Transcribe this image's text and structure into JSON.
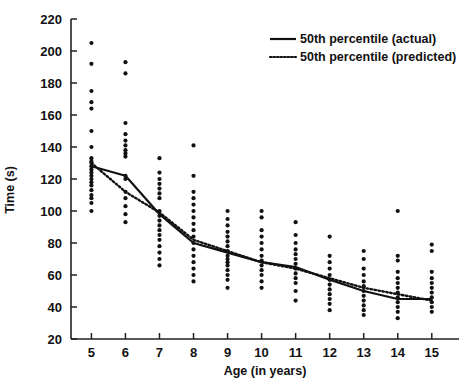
{
  "chart_data": {
    "type": "scatter",
    "title": "",
    "xlabel": "Age (in years)",
    "ylabel": "Time (s)",
    "xlim": [
      4.4,
      15.8
    ],
    "ylim": [
      20,
      220
    ],
    "xticks": [
      5,
      6,
      7,
      8,
      9,
      10,
      11,
      12,
      13,
      14,
      15
    ],
    "yticks": [
      20,
      40,
      60,
      80,
      100,
      120,
      140,
      160,
      180,
      200,
      220
    ],
    "grid": false,
    "legend_position": "top-right",
    "legend": [
      {
        "label": "50th percentile (actual)",
        "style": "solid",
        "color": "#111111"
      },
      {
        "label": "50th percentile (predicted)",
        "style": "dotted",
        "color": "#111111"
      }
    ],
    "series": [
      {
        "name": "50th percentile (actual)",
        "style": "solid",
        "x": [
          5,
          6,
          7,
          8,
          9,
          10,
          11,
          12,
          13,
          14,
          15
        ],
        "values": [
          128,
          122,
          98,
          80,
          74,
          68,
          65,
          57,
          50,
          45,
          45
        ]
      },
      {
        "name": "50th percentile (predicted)",
        "style": "dotted",
        "x": [
          5,
          6,
          7,
          8,
          9,
          10,
          11,
          12,
          13,
          14,
          15
        ],
        "values": [
          130,
          112,
          99,
          82,
          75,
          68,
          64,
          58,
          52,
          48,
          44
        ]
      }
    ],
    "scatter": {
      "name": "individual observations",
      "marker": "filled-circle",
      "color": "#111111",
      "points_by_age": {
        "5": [
          205,
          192,
          175,
          168,
          164,
          150,
          140,
          133,
          131,
          130,
          128,
          126,
          124,
          122,
          120,
          118,
          116,
          113,
          110,
          108,
          105,
          100
        ],
        "6": [
          193,
          186,
          155,
          148,
          144,
          141,
          138,
          136,
          134,
          122,
          120,
          112,
          108,
          103,
          98,
          93
        ],
        "7": [
          133,
          124,
          120,
          117,
          114,
          111,
          108,
          100,
          97,
          94,
          91,
          88,
          85,
          82,
          78,
          74,
          70,
          66
        ],
        "8": [
          141,
          122,
          112,
          108,
          104,
          100,
          96,
          92,
          88,
          84,
          80,
          76,
          72,
          68,
          64,
          60,
          56
        ],
        "9": [
          100,
          95,
          91,
          87,
          84,
          81,
          78,
          75,
          72,
          70,
          68,
          66,
          63,
          60,
          57,
          52
        ],
        "10": [
          100,
          96,
          88,
          84,
          80,
          76,
          72,
          69,
          66,
          63,
          60,
          56,
          52
        ],
        "11": [
          93,
          85,
          80,
          76,
          73,
          70,
          67,
          64,
          61,
          58,
          55,
          50,
          44
        ],
        "12": [
          84,
          72,
          68,
          64,
          60,
          57,
          54,
          51,
          48,
          45,
          42,
          38
        ],
        "13": [
          75,
          70,
          64,
          60,
          56,
          53,
          50,
          47,
          44,
          41,
          38,
          35
        ],
        "14": [
          100,
          72,
          69,
          62,
          58,
          55,
          52,
          49,
          46,
          43,
          40,
          37,
          33
        ],
        "15": [
          79,
          75,
          62,
          58,
          55,
          52,
          49,
          46,
          43,
          40,
          37
        ]
      }
    }
  },
  "axes": {
    "y_title": "Time (s)",
    "x_title": "Age (in years)"
  }
}
